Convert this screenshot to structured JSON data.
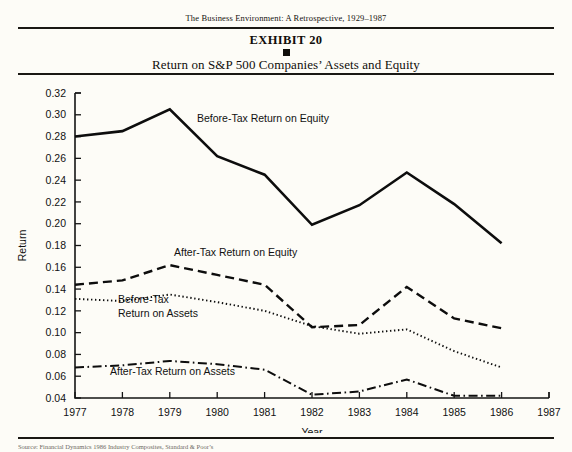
{
  "page": {
    "running_head": "The Business Environment: A Retrospective, 1929–1987",
    "exhibit_number": "EXHIBIT 20",
    "exhibit_title": "Return on S&P 500 Companies’ Assets and Equity",
    "source_note": "Source: Financial Dynamics 1986 Industry Composites, Standard & Poor’s"
  },
  "chart_data": {
    "type": "line",
    "title": "Return on S&P 500 Companies’ Assets and Equity",
    "xlabel": "Year",
    "ylabel": "Return",
    "x": [
      1977,
      1978,
      1979,
      1980,
      1981,
      1982,
      1983,
      1984,
      1985,
      1986
    ],
    "xlim": [
      1977,
      1987
    ],
    "ylim": [
      0.04,
      0.32
    ],
    "xticks": [
      "1977",
      "1978",
      "1979",
      "1980",
      "1981",
      "1982",
      "1983",
      "1984",
      "1985",
      "1986",
      "1987"
    ],
    "yticks": [
      "0.04",
      "0.06",
      "0.08",
      "0.10",
      "0.12",
      "0.14",
      "0.16",
      "0.18",
      "0.20",
      "0.22",
      "0.24",
      "0.26",
      "0.28",
      "0.30",
      "0.32"
    ],
    "grid": false,
    "legend_position": "inline-annotations",
    "series": [
      {
        "name": "Before-Tax Return on Equity",
        "style": "solid",
        "values": [
          0.28,
          0.285,
          0.305,
          0.262,
          0.245,
          0.199,
          0.217,
          0.247,
          0.218,
          0.182
        ]
      },
      {
        "name": "After-Tax Return on Equity",
        "style": "dashed",
        "values": [
          0.144,
          0.148,
          0.162,
          0.153,
          0.144,
          0.105,
          0.107,
          0.142,
          0.113,
          0.104
        ]
      },
      {
        "name": "Before-Tax Return on Assets",
        "style": "dotted",
        "values": [
          0.131,
          0.129,
          0.135,
          0.128,
          0.12,
          0.106,
          0.099,
          0.103,
          0.083,
          0.068
        ]
      },
      {
        "name": "After-Tax Return on Assets",
        "style": "dash-dot",
        "values": [
          0.068,
          0.07,
          0.074,
          0.071,
          0.066,
          0.043,
          0.046,
          0.057,
          0.042,
          0.042
        ]
      }
    ],
    "annotations": [
      {
        "text": "Before-Tax Return on Equity",
        "x_px": 197,
        "y_px": 44
      },
      {
        "text": "After-Tax Return on Equity",
        "x_px": 174,
        "y_px": 178
      },
      {
        "text": "Before-Tax",
        "x_px": 118,
        "y_px": 225
      },
      {
        "text": "Return on Assets",
        "x_px": 118,
        "y_px": 239
      },
      {
        "text": "After-Tax Return on Assets",
        "x_px": 110,
        "y_px": 297
      }
    ],
    "colors": {
      "line": "#0d0d0d",
      "background": "#fdfcf7",
      "text": "#111111"
    }
  }
}
